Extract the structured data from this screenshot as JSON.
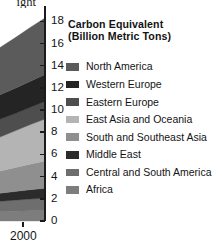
{
  "bleed_text": {
    "line1": "ight",
    "line2": "uage",
    "line3": "as"
  },
  "legend": {
    "title_line1": "Carbon Equivalent",
    "title_line2": "(Billion Metric Tons)",
    "items": [
      {
        "label": "North America",
        "color": "#5b5b5b"
      },
      {
        "label": "Western Europe",
        "color": "#242424"
      },
      {
        "label": "Eastern Europe",
        "color": "#4e4e4e"
      },
      {
        "label": "East Asia and Oceania",
        "color": "#b4b4b4"
      },
      {
        "label": "South and Southeast Asia",
        "color": "#8f8f8f"
      },
      {
        "label": "Middle East",
        "color": "#2b2b2b"
      },
      {
        "label": "Central and South America",
        "color": "#6e6e6e"
      },
      {
        "label": "Africa",
        "color": "#7d7d7d"
      }
    ]
  },
  "axis": {
    "y_ticks": [
      "18",
      "16",
      "14",
      "12",
      "10",
      "8",
      "6",
      "4",
      "2",
      "0"
    ],
    "x_ticks": [
      "2000"
    ],
    "y_min": 0,
    "y_max": 19.2
  },
  "chart_data": {
    "type": "area",
    "stacked": true,
    "title": "Carbon Equivalent (Billion Metric Tons)",
    "xlabel": "",
    "ylabel": "Carbon Equivalent (Billion Metric Tons)",
    "ylim": [
      0,
      19.2
    ],
    "xlim": [
      1988,
      2000
    ],
    "grid": false,
    "legend_position": "right",
    "note": "Cropped right-hand portion of a larger stacked area chart; only the final years up to 2000 are visible.",
    "x": [
      1988,
      1990,
      1992,
      1994,
      1996,
      1998,
      2000
    ],
    "series": [
      {
        "name": "Africa",
        "color": "#7d7d7d",
        "values": [
          0.75,
          0.78,
          0.8,
          0.84,
          0.88,
          0.92,
          0.95
        ]
      },
      {
        "name": "Central and South America",
        "color": "#6e6e6e",
        "values": [
          0.8,
          0.84,
          0.88,
          0.94,
          1.0,
          1.06,
          1.1
        ]
      },
      {
        "name": "Middle East",
        "color": "#2b2b2b",
        "values": [
          0.55,
          0.6,
          0.66,
          0.72,
          0.78,
          0.84,
          0.9
        ]
      },
      {
        "name": "South and Southeast Asia",
        "color": "#8f8f8f",
        "values": [
          1.55,
          1.7,
          1.85,
          2.0,
          2.15,
          2.3,
          2.45
        ]
      },
      {
        "name": "East Asia and Oceania",
        "color": "#b4b4b4",
        "values": [
          2.3,
          2.55,
          2.8,
          3.05,
          3.3,
          3.55,
          3.8
        ]
      },
      {
        "name": "Eastern Europe",
        "color": "#4e4e4e",
        "values": [
          2.05,
          1.95,
          1.75,
          1.6,
          1.55,
          1.55,
          1.58
        ]
      },
      {
        "name": "Western Europe",
        "color": "#242424",
        "values": [
          2.05,
          2.1,
          2.15,
          2.2,
          2.28,
          2.35,
          2.42
        ]
      },
      {
        "name": "North America",
        "color": "#5b5b5b",
        "values": [
          3.5,
          3.7,
          3.95,
          4.25,
          4.55,
          4.85,
          5.1
        ]
      }
    ]
  }
}
